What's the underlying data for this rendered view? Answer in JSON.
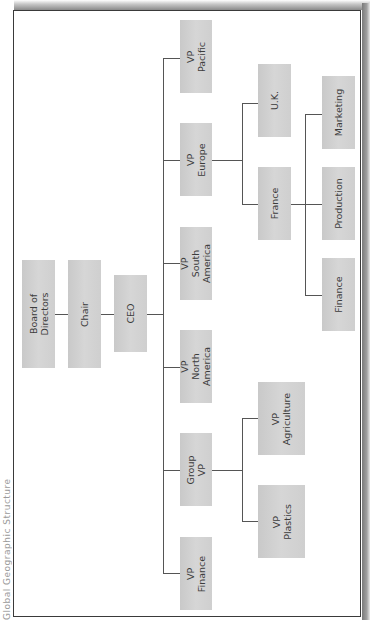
{
  "caption": "Global Geographic Structure",
  "chart_title": "Global Geographic Structure",
  "org_chart": {
    "board": {
      "label": "Board of Directors"
    },
    "chair": {
      "label": "Chair"
    },
    "ceo": {
      "label": "CEO"
    },
    "vps": [
      {
        "label": "VP\nPacific"
      },
      {
        "label": "VP\nEurope"
      },
      {
        "label": "VP South\nAmerica"
      },
      {
        "label": "VP North\nAmerica"
      },
      {
        "label": "Group VP"
      },
      {
        "label": "VP\nFinance"
      }
    ],
    "europe_children": [
      {
        "label": "U.K."
      },
      {
        "label": "France"
      }
    ],
    "france_children": [
      {
        "label": "Marketing"
      },
      {
        "label": "Production"
      },
      {
        "label": "Finance"
      }
    ],
    "group_vp_children": [
      {
        "label": "VP\nAgriculture"
      },
      {
        "label": "VP\nPlastics"
      }
    ]
  },
  "colors": {
    "box_fill": "#d0d0d0",
    "line": "#555555",
    "text": "#3c3c3c",
    "frame": "#3a3a3a"
  }
}
